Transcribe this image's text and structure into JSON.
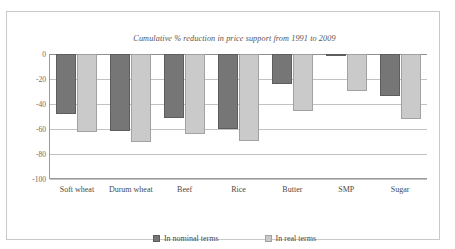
{
  "chart_data": {
    "type": "bar",
    "title": "Cumulative % reduction in price support from 1991 to 2009",
    "xlabel": "",
    "ylabel": "",
    "ylim": [
      -100,
      0
    ],
    "yticks": [
      0,
      -20,
      -40,
      -60,
      -80,
      -100
    ],
    "ytick_labels": [
      "0",
      "-20",
      "-40",
      "-60",
      "-80",
      "-100"
    ],
    "grid": true,
    "legend_position": "bottom",
    "categories": [
      "Soft wheat",
      "Durum wheat",
      "Beef",
      "Rice",
      "Butter",
      "SMP",
      "Sugar"
    ],
    "series": [
      {
        "name": "In nominal terms",
        "color": "#767676",
        "values": [
          -48,
          -61.5,
          -51,
          -60,
          -24,
          -1.5,
          -33.5
        ]
      },
      {
        "name": "In real terms",
        "color": "#cacaca",
        "values": [
          -62.5,
          -70.5,
          -64,
          -69.5,
          -45.5,
          -29.5,
          -52
        ]
      }
    ]
  },
  "legend": {
    "items": [
      {
        "label": "In nominal terms",
        "swatch": "nominal-swatch-icon"
      },
      {
        "label": "In real terms",
        "swatch": "real-swatch-icon"
      }
    ]
  }
}
